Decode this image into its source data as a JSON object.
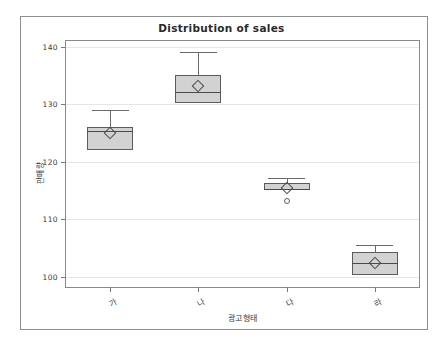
{
  "figure": {
    "background": "#ffffff",
    "frame_color": "#8f8f8f"
  },
  "chart_data": {
    "type": "box",
    "title": "Distribution of sales",
    "xlabel": "광고형태",
    "ylabel": "판매량",
    "categories": [
      "가",
      "나",
      "다",
      "라"
    ],
    "ylim": [
      98.2,
      141.0
    ],
    "yticks": [
      100,
      110,
      120,
      130,
      140
    ],
    "ytick_labels": [
      "100",
      "110",
      "120",
      "130",
      "140"
    ],
    "grid": true,
    "grid_axis": "y",
    "legend": "none",
    "box_fill": "#d2d2d2",
    "box_edge": "#5c5c5c",
    "boxes": [
      {
        "category": "가",
        "whisker_low": 122.0,
        "q1": 122.0,
        "median": 125.3,
        "q3": 126.0,
        "whisker_high": 129.0,
        "mean": 125.0,
        "outliers": []
      },
      {
        "category": "나",
        "whisker_low": 130.2,
        "q1": 130.2,
        "median": 132.2,
        "q3": 135.0,
        "whisker_high": 139.0,
        "mean": 133.1,
        "outliers": []
      },
      {
        "category": "다",
        "whisker_low": 115.0,
        "q1": 115.0,
        "median": 115.3,
        "q3": 116.3,
        "whisker_high": 117.2,
        "mean": 115.4,
        "outliers": [
          113.2
        ]
      },
      {
        "category": "라",
        "whisker_low": 100.3,
        "q1": 100.3,
        "median": 102.3,
        "q3": 104.3,
        "whisker_high": 105.5,
        "mean": 102.4,
        "outliers": []
      }
    ]
  }
}
